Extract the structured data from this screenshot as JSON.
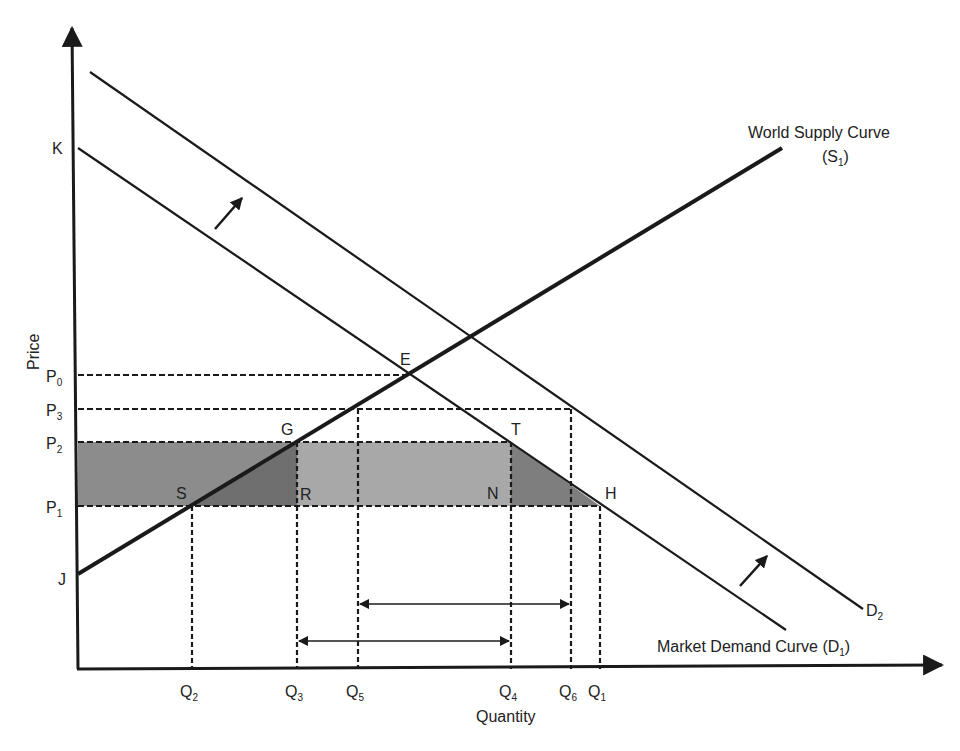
{
  "colors": {
    "line": "#1a1a1a",
    "shade_left": "#8c8c8c",
    "shade_middle": "#a8a8a8",
    "shade_triangle_left": "#6f6f6f",
    "shade_triangle_right": "#7e7e7e"
  },
  "axes": {
    "x_label": "Quantity",
    "y_label": "Price",
    "origin": [
      78,
      669
    ],
    "x_end": [
      942,
      665
    ],
    "y_end": [
      72,
      28
    ]
  },
  "price_levels": [
    {
      "id": "P0",
      "base": "P",
      "sub": "0",
      "y": 375,
      "x_end": 409
    },
    {
      "id": "P3",
      "base": "P",
      "sub": "3",
      "y": 409,
      "x_end": 571
    },
    {
      "id": "P2",
      "base": "P",
      "sub": "2",
      "y": 442,
      "x_end": 511
    },
    {
      "id": "P1",
      "base": "P",
      "sub": "1",
      "y": 506,
      "x_end": 600
    }
  ],
  "quantity_levels": [
    {
      "id": "Q2",
      "base": "Q",
      "sub": "2",
      "x": 192,
      "y_top": 506
    },
    {
      "id": "Q3",
      "base": "Q",
      "sub": "3",
      "x": 297,
      "y_top": 442
    },
    {
      "id": "Q5",
      "base": "Q",
      "sub": "5",
      "x": 358,
      "y_top": 409
    },
    {
      "id": "Q4",
      "base": "Q",
      "sub": "4",
      "x": 511,
      "y_top": 442
    },
    {
      "id": "Q6",
      "base": "Q",
      "sub": "6",
      "x": 571,
      "y_top": 409
    },
    {
      "id": "Q1",
      "base": "Q",
      "sub": "1",
      "x": 600,
      "y_top": 506
    }
  ],
  "curves": {
    "world_supply": {
      "label": "World Supply Curve",
      "label_sub": "(S",
      "label_sub_index": "1",
      "label_sub_close": ")",
      "from": [
        78,
        574
      ],
      "to": [
        782,
        148
      ]
    },
    "demand_d1": {
      "label": "Market Demand Curve (D",
      "label_index": "1",
      "label_close": ")",
      "from": [
        78,
        148
      ],
      "to": [
        786,
        630
      ]
    },
    "demand_d2": {
      "label": "D",
      "label_index": "2",
      "from": [
        90,
        72
      ],
      "to": [
        863,
        609
      ]
    }
  },
  "points": [
    {
      "name": "K",
      "x": 52,
      "y": 154
    },
    {
      "name": "J",
      "x": 58,
      "y": 585
    },
    {
      "name": "E",
      "x": 400,
      "y": 365
    },
    {
      "name": "G",
      "x": 281,
      "y": 435
    },
    {
      "name": "S",
      "x": 176,
      "y": 499
    },
    {
      "name": "R",
      "x": 300,
      "y": 500
    },
    {
      "name": "T",
      "x": 511,
      "y": 435
    },
    {
      "name": "N",
      "x": 487,
      "y": 499
    },
    {
      "name": "H",
      "x": 605,
      "y": 499
    }
  ],
  "shift_arrows": [
    {
      "from": [
        215,
        229
      ],
      "to": [
        242,
        198
      ]
    },
    {
      "from": [
        740,
        586
      ],
      "to": [
        767,
        556
      ]
    }
  ],
  "range_arrows": [
    {
      "name": "imports-after-shift",
      "from_x": 358,
      "to_x": 571,
      "y": 604
    },
    {
      "name": "imports-before-shift",
      "from_x": 297,
      "to_x": 511,
      "y": 641
    }
  ],
  "shaded_regions": {
    "left_band": {
      "x0": 78,
      "x1": 297,
      "y0": 442,
      "y1": 506
    },
    "triangle_SGR": [
      [
        190,
        506
      ],
      [
        297,
        442
      ],
      [
        297,
        506
      ]
    ],
    "middle_band": {
      "x0": 297,
      "x1": 511,
      "y0": 442,
      "y1": 506
    },
    "triangle_TNH": [
      [
        511,
        442
      ],
      [
        511,
        506
      ],
      [
        600,
        506
      ]
    ]
  }
}
